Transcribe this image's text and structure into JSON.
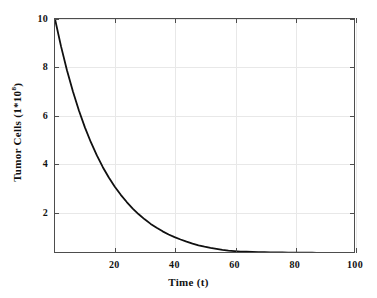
{
  "chart_data": {
    "type": "line",
    "title": "",
    "xlabel": "Time (t)",
    "ylabel": "Tumor Cells (1*10^8)",
    "ylabel_base": "Tumor Cells (1*10",
    "ylabel_exponent": "8",
    "ylabel_suffix": ")",
    "xlim": [
      0,
      100
    ],
    "ylim": [
      0.3,
      10
    ],
    "xticks": [
      20,
      40,
      60,
      80,
      100
    ],
    "xtick_labels": [
      "20",
      "40",
      "60",
      "80",
      "100"
    ],
    "yticks": [
      2,
      4,
      6,
      8,
      10
    ],
    "ytick_labels": [
      "2",
      "4",
      "6",
      "8",
      "10"
    ],
    "grid": true,
    "grid_color": "#e8e8e8",
    "legend": null,
    "series": [
      {
        "name": "Tumor Cells",
        "color": "#101010",
        "line_width": 1.8,
        "x": [
          0,
          2,
          4,
          6,
          8,
          10,
          12,
          14,
          16,
          18,
          20,
          22,
          24,
          26,
          28,
          30,
          32,
          34,
          36,
          38,
          40,
          42,
          44,
          46,
          48,
          50,
          52,
          54,
          56,
          58,
          60,
          62,
          64,
          66,
          68,
          70,
          72,
          74,
          76,
          78,
          80,
          82,
          84,
          86,
          88,
          90,
          92,
          94,
          96,
          98,
          100
        ],
        "y": [
          10.0,
          8.87,
          7.87,
          6.98,
          6.19,
          5.49,
          4.87,
          4.32,
          3.83,
          3.4,
          3.02,
          2.68,
          2.38,
          2.11,
          1.87,
          1.66,
          1.47,
          1.31,
          1.16,
          1.03,
          0.92,
          0.82,
          0.73,
          0.65,
          0.58,
          0.52,
          0.47,
          0.43,
          0.39,
          0.36,
          0.34,
          0.32,
          0.31,
          0.3,
          0.29,
          0.29,
          0.28,
          0.28,
          0.28,
          0.27,
          0.27,
          0.27,
          0.27,
          0.27,
          0.26,
          0.26,
          0.26,
          0.26,
          0.26,
          0.26,
          0.26
        ]
      }
    ]
  },
  "axis": {
    "frame_color": "#4d4d4d"
  }
}
